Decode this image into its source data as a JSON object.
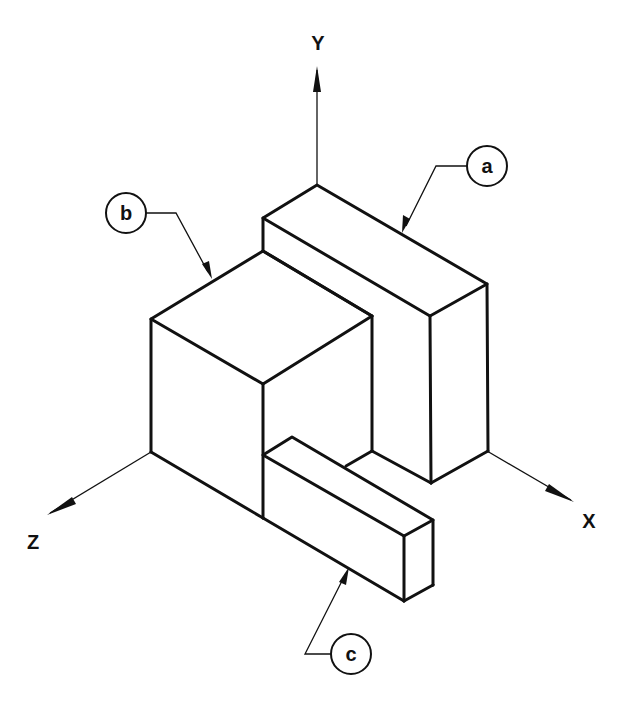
{
  "diagram": {
    "type": "isometric-drawing",
    "background": "#ffffff",
    "line_color": "#111111",
    "axes": [
      {
        "label": "Y",
        "direction": "up"
      },
      {
        "label": "X",
        "direction": "lower-right"
      },
      {
        "label": "Z",
        "direction": "lower-left"
      }
    ],
    "callouts": [
      {
        "label": "a",
        "target": "tall back block"
      },
      {
        "label": "b",
        "target": "front cube"
      },
      {
        "label": "c",
        "target": "low front bar"
      }
    ]
  }
}
